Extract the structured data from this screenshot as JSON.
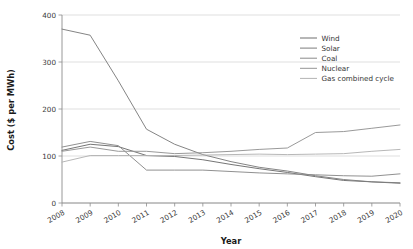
{
  "chart_data": {
    "type": "line",
    "title": "",
    "xlabel": "Year",
    "ylabel": "Cost ($ per MWh)",
    "x": [
      2008,
      2009,
      2010,
      2011,
      2012,
      2013,
      2014,
      2015,
      2016,
      2017,
      2018,
      2019,
      2020
    ],
    "xlim": [
      2008,
      2020
    ],
    "ylim": [
      0,
      400
    ],
    "yticks": [
      0,
      100,
      200,
      300,
      400
    ],
    "xticks": [
      "2008",
      "2009",
      "2010",
      "2011",
      "2012",
      "2013",
      "2014",
      "2015",
      "2016",
      "2017",
      "2018",
      "2019",
      "2020"
    ],
    "grid": true,
    "legend_position": "upper right",
    "series": [
      {
        "name": "Wind",
        "color": "#6e6e6e",
        "values": [
          112,
          125,
          120,
          101,
          99,
          92,
          82,
          73,
          65,
          56,
          48,
          45,
          42
        ]
      },
      {
        "name": "Solar",
        "color": "#7d7d7d",
        "values": [
          370,
          357,
          260,
          157,
          125,
          103,
          88,
          76,
          68,
          58,
          50,
          45,
          43
        ]
      },
      {
        "name": "Coal",
        "color": "#8a8a8a",
        "values": [
          119,
          131,
          122,
          70,
          70,
          70,
          67,
          64,
          62,
          60,
          58,
          57,
          62
        ]
      },
      {
        "name": "Nuclear",
        "color": "#949494",
        "values": [
          110,
          119,
          110,
          110,
          105,
          107,
          110,
          114,
          117,
          150,
          152,
          159,
          166
        ]
      },
      {
        "name": "Gas combined cycle",
        "color": "#b3b3b3",
        "values": [
          87,
          101,
          101,
          101,
          101,
          102,
          103,
          104,
          103,
          104,
          105,
          110,
          114
        ]
      }
    ]
  },
  "axes": {
    "y_tick_labels": [
      "0",
      "100",
      "200",
      "300",
      "400"
    ],
    "x_tick_labels": [
      "2008",
      "2009",
      "2010",
      "2011",
      "2012",
      "2013",
      "2014",
      "2015",
      "2016",
      "2017",
      "2018",
      "2019",
      "2020"
    ],
    "y_axis_title": "Cost ($ per MWh)",
    "x_axis_title": "Year"
  },
  "legend": {
    "entries": [
      {
        "label": "Wind"
      },
      {
        "label": "Solar"
      },
      {
        "label": "Coal"
      },
      {
        "label": "Nuclear"
      },
      {
        "label": "Gas combined cycle"
      }
    ]
  }
}
